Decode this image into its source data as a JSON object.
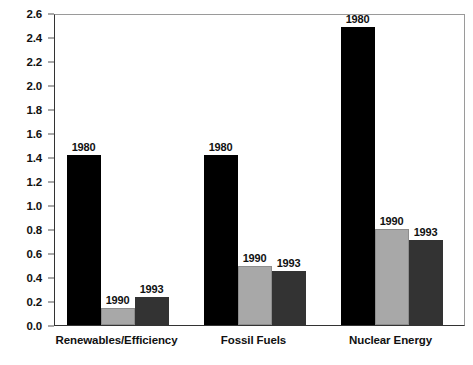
{
  "chart_data": {
    "type": "bar",
    "title": "",
    "subtitle": "",
    "xlabel": "",
    "ylabel": "",
    "categories": [
      "Renewables/Efficiency",
      "Fossil Fuels",
      "Nuclear Energy"
    ],
    "series": [
      {
        "name": "1980",
        "color": "#000000",
        "values": [
          1.42,
          1.42,
          2.48
        ]
      },
      {
        "name": "1990",
        "color": "#a8a8a8",
        "values": [
          0.14,
          0.49,
          0.8
        ]
      },
      {
        "name": "1993",
        "color": "#333333",
        "values": [
          0.23,
          0.45,
          0.71
        ]
      }
    ],
    "bar_labels": [
      [
        "1980",
        "1990",
        "1993"
      ],
      [
        "1980",
        "1990",
        "1993"
      ],
      [
        "1980",
        "1990",
        "1993"
      ]
    ],
    "ylim": [
      0.0,
      2.6
    ],
    "ytick_step": 0.2,
    "yticks": [
      "0.0",
      "0.2",
      "0.4",
      "0.6",
      "0.8",
      "1.0",
      "1.2",
      "1.4",
      "1.6",
      "1.8",
      "2.0",
      "2.2",
      "2.4",
      "2.6"
    ],
    "grid": false,
    "legend": "none",
    "legend_position": "none",
    "frame": true,
    "annotations": []
  },
  "colors": {
    "series_1980": "#000000",
    "series_1990": "#a8a8a8",
    "series_1993": "#333333",
    "frame": "#9a9a9a",
    "axis": "#333333",
    "text": "#111111",
    "background": "#ffffff"
  }
}
